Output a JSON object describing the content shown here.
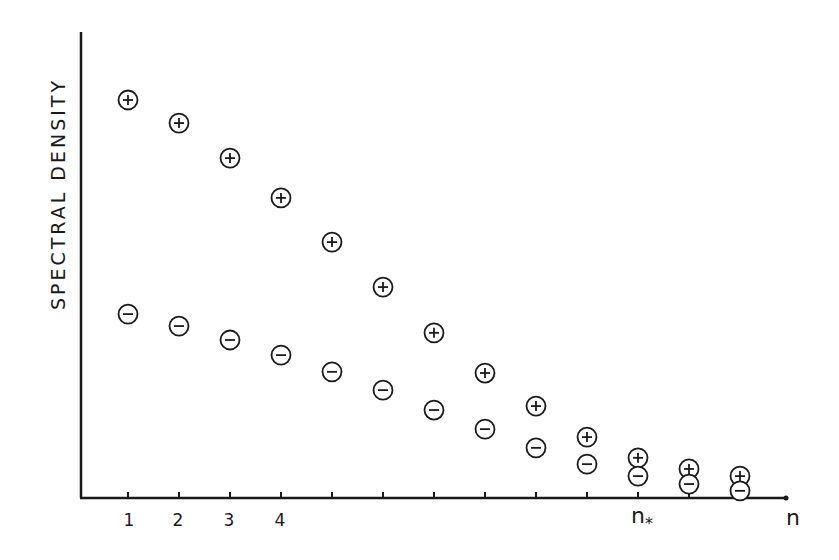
{
  "chart_data": {
    "type": "scatter",
    "title": "",
    "xlabel": "n",
    "ylabel": "SPECTRAL DENSITY",
    "x_tick_labels": [
      "1",
      "2",
      "3",
      "4",
      "",
      "",
      "",
      "",
      "",
      "",
      "n*",
      "",
      ""
    ],
    "x": [
      1,
      2,
      3,
      4,
      5,
      6,
      7,
      8,
      9,
      10,
      11,
      12,
      13
    ],
    "special_ticks": {
      "n_star": 11
    },
    "grid": false,
    "legend": "none",
    "y_units": "arbitrary (normalized, top point = 100)",
    "ylim": [
      0,
      108
    ],
    "series": [
      {
        "name": "+",
        "marker": "circled-plus",
        "values": [
          100,
          94.2,
          85.4,
          75.4,
          64.3,
          53.0,
          41.5,
          31.4,
          23.1,
          15.3,
          10.1,
          7.3,
          5.5
        ]
      },
      {
        "name": "-",
        "marker": "circled-minus",
        "values": [
          46.2,
          43.2,
          39.7,
          35.9,
          31.7,
          27.1,
          22.1,
          17.3,
          12.6,
          8.5,
          5.5,
          3.5,
          1.8
        ]
      }
    ]
  },
  "labels": {
    "ylabel": "SPECTRAL DENSITY",
    "xlabel": "n",
    "tick_1": "1",
    "tick_2": "2",
    "tick_3": "3",
    "tick_4": "4",
    "nstar_base": "n",
    "nstar_sub": "*"
  },
  "colors": {
    "ink": "#1a1a1a",
    "background": "#ffffff"
  }
}
